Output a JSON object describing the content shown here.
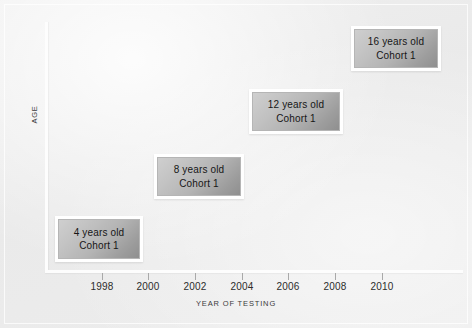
{
  "figure": {
    "background_color": "#eeeeee",
    "axis_color": "#fdfdfd",
    "box_fill_color": "#b4b4b4",
    "box_border_color": "#ffffff",
    "text_color": "#161616"
  },
  "axes": {
    "y_label": "AGE",
    "x_label": "YEAR OF TESTING"
  },
  "x_ticks": [
    {
      "label": "1998",
      "x": 102
    },
    {
      "label": "2000",
      "x": 148
    },
    {
      "label": "2002",
      "x": 195
    },
    {
      "label": "2004",
      "x": 242
    },
    {
      "label": "2006",
      "x": 288
    },
    {
      "label": "2008",
      "x": 335
    },
    {
      "label": "2010",
      "x": 382
    }
  ],
  "data_boxes": [
    {
      "line1": "4 years old",
      "line2": "Cohort 1",
      "left": 55,
      "top": 216,
      "width": 88,
      "height": 46
    },
    {
      "line1": "8 years old",
      "line2": "Cohort 1",
      "left": 154,
      "top": 154,
      "width": 90,
      "height": 45
    },
    {
      "line1": "12 years old",
      "line2": "Cohort 1",
      "left": 249,
      "top": 89,
      "width": 94,
      "height": 45
    },
    {
      "line1": "16 years old",
      "line2": "Cohort 1",
      "left": 351,
      "top": 26,
      "width": 90,
      "height": 45
    }
  ],
  "chart_data": {
    "type": "scatter",
    "title": "",
    "subtitle": "",
    "xlabel": "YEAR OF TESTING",
    "ylabel": "AGE",
    "xlim": [
      1996,
      2011
    ],
    "ylim": [
      0,
      20
    ],
    "grid": false,
    "legend": "none",
    "x_tick_labels": [
      "1998",
      "2000",
      "2002",
      "2004",
      "2006",
      "2008",
      "2010"
    ],
    "x_tick_values": [
      1998,
      2000,
      2002,
      2004,
      2006,
      2008,
      2010
    ],
    "y_tick_labels": [],
    "series": [
      {
        "name": "Cohort 1",
        "point_labels": [
          "4 years old\nCohort 1",
          "8 years old\nCohort 1",
          "12 years old\nCohort 1",
          "16 years old\nCohort 1"
        ],
        "x": [
          1996.5,
          1999.4,
          2003.5,
          2007.3
        ],
        "y": [
          4,
          8,
          12,
          16
        ]
      }
    ],
    "annotations": [
      "4 years old Cohort 1",
      "8 years old Cohort 1",
      "12 years old Cohort 1",
      "16 years old Cohort 1"
    ]
  }
}
